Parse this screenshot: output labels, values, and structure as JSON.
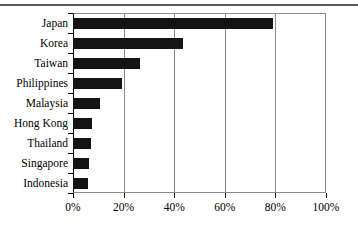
{
  "figure": {
    "name": "horizontal-bar-chart",
    "rule_color": "#595959",
    "bar_color": "#141414",
    "frame_color": "#8c8c8c",
    "axis_color": "#000000"
  },
  "chart_data": {
    "type": "bar",
    "orientation": "horizontal",
    "title": "",
    "subtitle": "",
    "xlabel": "",
    "ylabel": "",
    "categories": [
      "Japan",
      "Korea",
      "Taiwan",
      "Philippines",
      "Malaysia",
      "Hong Kong",
      "Thailand",
      "Singapore",
      "Indonesia"
    ],
    "values": [
      79,
      43.5,
      26.5,
      19.5,
      10.5,
      7.5,
      7,
      6.3,
      6
    ],
    "value_unit": "%",
    "xlim": [
      0,
      100
    ],
    "xticks": [
      0,
      20,
      40,
      60,
      80,
      100
    ],
    "xtick_labels": [
      "0%",
      "20%",
      "40%",
      "60%",
      "80%",
      "100%"
    ],
    "grid": "vertical",
    "legend": "none",
    "series": [
      {
        "name": "share",
        "values": [
          79,
          43.5,
          26.5,
          19.5,
          10.5,
          7.5,
          7,
          6.3,
          6
        ]
      }
    ]
  }
}
